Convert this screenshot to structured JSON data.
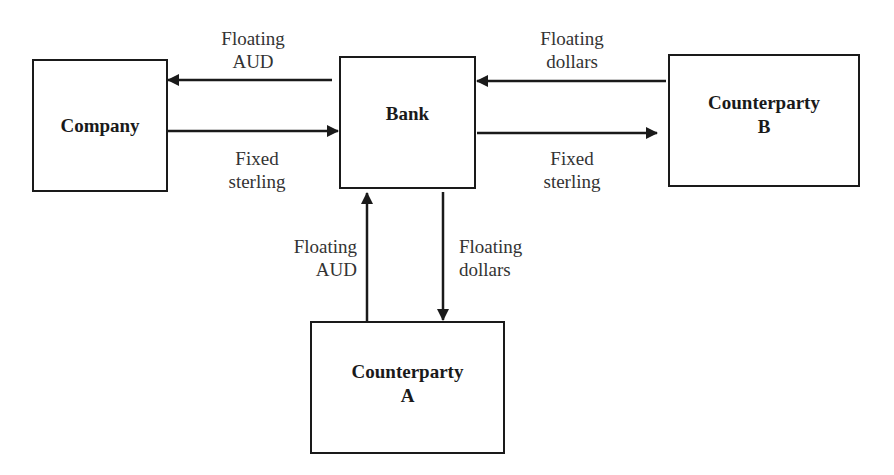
{
  "nodes": {
    "company": {
      "label": "Company"
    },
    "bank": {
      "label": "Bank"
    },
    "counterparty_b": {
      "label": "Counterparty\nB"
    },
    "counterparty_a": {
      "label": "Counterparty\nA"
    }
  },
  "flows": {
    "bank_to_company": {
      "label": "Floating\nAUD"
    },
    "company_to_bank": {
      "label": "Fixed\nsterling"
    },
    "cpb_to_bank": {
      "label": "Floating\ndollars"
    },
    "bank_to_cpb": {
      "label": "Fixed\nsterling"
    },
    "cpa_to_bank": {
      "label": "Floating\nAUD"
    },
    "bank_to_cpa": {
      "label": "Floating\ndollars"
    }
  },
  "colors": {
    "stroke": "#1a1a1a",
    "background": "#ffffff"
  }
}
